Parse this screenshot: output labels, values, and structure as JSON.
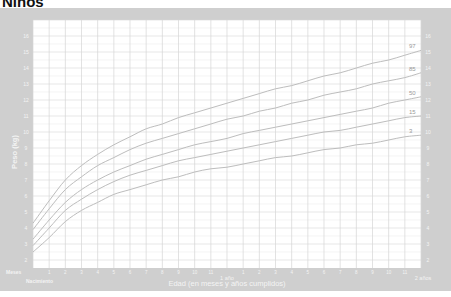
{
  "title": "Niños",
  "colors": {
    "frame": "#cfcfcf",
    "plot_bg": "#ffffff",
    "grid_major": "#d6d6d6",
    "grid_minor": "#ececec",
    "curve": "#bdbdbd",
    "axis_text": "#f4f4f4"
  },
  "chart_data": {
    "type": "line",
    "title": "Niños",
    "xlabel": "Edad (en meses y años cumplidos)",
    "ylabel": "Peso (kg)",
    "x_unit_label": "Meses",
    "x_start_label": "Nacimiento",
    "xlim": [
      0,
      24
    ],
    "ylim": [
      1.5,
      17
    ],
    "grid": true,
    "x_tick_labels": [
      "Nacimiento",
      "1",
      "2",
      "3",
      "4",
      "5",
      "6",
      "7",
      "8",
      "9",
      "10",
      "11",
      "1 año",
      "1",
      "2",
      "3",
      "4",
      "5",
      "6",
      "7",
      "8",
      "9",
      "10",
      "11",
      "2 años"
    ],
    "y_ticks": [
      2,
      3,
      4,
      5,
      6,
      7,
      8,
      9,
      10,
      11,
      12,
      13,
      14,
      15,
      16
    ],
    "x": [
      0,
      1,
      2,
      3,
      4,
      5,
      6,
      7,
      8,
      9,
      10,
      11,
      12,
      13,
      14,
      15,
      16,
      17,
      18,
      19,
      20,
      21,
      22,
      23,
      24
    ],
    "series": [
      {
        "name": "97",
        "values": [
          4.3,
          5.7,
          7.0,
          7.9,
          8.6,
          9.2,
          9.7,
          10.2,
          10.5,
          10.9,
          11.2,
          11.5,
          11.8,
          12.1,
          12.4,
          12.7,
          12.9,
          13.2,
          13.5,
          13.7,
          14.0,
          14.3,
          14.5,
          14.8,
          15.1
        ]
      },
      {
        "name": "85",
        "values": [
          3.9,
          5.2,
          6.4,
          7.2,
          7.9,
          8.4,
          8.9,
          9.3,
          9.6,
          9.9,
          10.2,
          10.5,
          10.8,
          11.0,
          11.3,
          11.5,
          11.8,
          12.0,
          12.3,
          12.5,
          12.7,
          13.0,
          13.2,
          13.4,
          13.7
        ]
      },
      {
        "name": "50",
        "values": [
          3.3,
          4.5,
          5.6,
          6.4,
          7.0,
          7.5,
          7.9,
          8.3,
          8.6,
          8.9,
          9.2,
          9.4,
          9.6,
          9.9,
          10.1,
          10.3,
          10.5,
          10.7,
          10.9,
          11.1,
          11.3,
          11.5,
          11.8,
          12.0,
          12.2
        ]
      },
      {
        "name": "15",
        "values": [
          2.9,
          4.0,
          5.1,
          5.8,
          6.4,
          6.9,
          7.3,
          7.6,
          7.9,
          8.2,
          8.4,
          8.6,
          8.8,
          9.0,
          9.2,
          9.4,
          9.6,
          9.8,
          10.0,
          10.1,
          10.3,
          10.5,
          10.7,
          10.9,
          11.0
        ]
      },
      {
        "name": "3",
        "values": [
          2.5,
          3.4,
          4.4,
          5.1,
          5.6,
          6.1,
          6.4,
          6.7,
          7.0,
          7.2,
          7.5,
          7.7,
          7.8,
          8.0,
          8.2,
          8.4,
          8.5,
          8.7,
          8.9,
          9.0,
          9.2,
          9.3,
          9.5,
          9.7,
          9.8
        ]
      }
    ]
  },
  "labels": {
    "ylabel": "Peso (kg)",
    "xlabel": "Edad (en meses y años cumplidos)",
    "meses": "Meses",
    "nacimiento": "Nacimiento",
    "one_year": "1 año",
    "two_years": "2 años"
  }
}
